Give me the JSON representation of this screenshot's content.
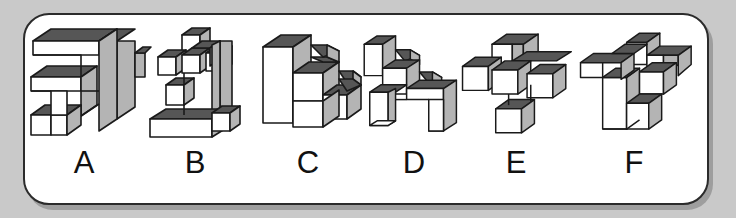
{
  "panel": {
    "background_color": "#ffffff",
    "border_color": "#2b2b2b",
    "page_background_color": "#c9c9c9",
    "corner_radius_px": 26
  },
  "palette": {
    "face_top": "#565656",
    "face_left": "#ffffff",
    "face_right": "#b4b4b4",
    "outline": "#1a1a1a"
  },
  "options": [
    {
      "label": "A",
      "description": "Flat plate folded into a spiral / G-shaped bracket made of long rectangular slabs",
      "cube_count": 12
    },
    {
      "label": "B",
      "description": "Upright column with a plus-shaped cluster of cubes at the top and an L-shaped foot at the base",
      "cube_count": 12
    },
    {
      "label": "C",
      "description": "Descending three-step staircase with a tall column at the back-left",
      "cube_count": 10
    },
    {
      "label": "D",
      "description": "Staircase of three steps mounted on a wide U-shaped base with two legs",
      "cube_count": 11
    },
    {
      "label": "E",
      "description": "Three-dimensional plus / cross of single cubes radiating from a centre cube",
      "cube_count": 7
    },
    {
      "label": "F",
      "description": "Three-dimensional cross with long arms and a hooked leg dropping down at the front",
      "cube_count": 11
    }
  ],
  "letters": [
    "A",
    "B",
    "C",
    "D",
    "E",
    "F"
  ]
}
